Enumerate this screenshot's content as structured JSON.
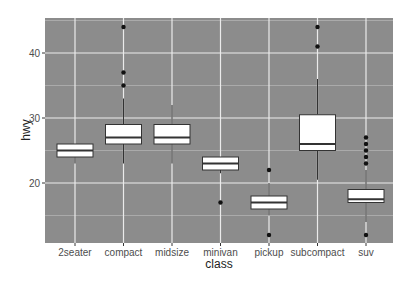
{
  "chart_data": {
    "type": "boxplot",
    "title": "",
    "xlabel": "class",
    "ylabel": "hwy",
    "ylim": [
      10.5,
      45.5
    ],
    "yticks": [
      20,
      30,
      40
    ],
    "grid": true,
    "categories": [
      "2seater",
      "compact",
      "midsize",
      "minivan",
      "pickup",
      "subcompact",
      "suv"
    ],
    "boxes": [
      {
        "category": "2seater",
        "lower_whisker": 23,
        "q1": 24,
        "median": 25,
        "q3": 26,
        "upper_whisker": 26,
        "outliers": []
      },
      {
        "category": "compact",
        "lower_whisker": 23,
        "q1": 26,
        "median": 27,
        "q3": 29,
        "upper_whisker": 33,
        "outliers": [
          35,
          37,
          44
        ]
      },
      {
        "category": "midsize",
        "lower_whisker": 23,
        "q1": 26,
        "median": 27,
        "q3": 29,
        "upper_whisker": 32,
        "outliers": []
      },
      {
        "category": "minivan",
        "lower_whisker": 21.5,
        "q1": 22,
        "median": 23,
        "q3": 24,
        "upper_whisker": 24,
        "outliers": [
          17
        ]
      },
      {
        "category": "pickup",
        "lower_whisker": 15,
        "q1": 16,
        "median": 17,
        "q3": 18,
        "upper_whisker": 20,
        "outliers": [
          12,
          22
        ]
      },
      {
        "category": "subcompact",
        "lower_whisker": 20.5,
        "q1": 25,
        "median": 26,
        "q3": 30.5,
        "upper_whisker": 36,
        "outliers": [
          41,
          44
        ]
      },
      {
        "category": "suv",
        "lower_whisker": 14,
        "q1": 17,
        "median": 17.5,
        "q3": 19,
        "upper_whisker": 22,
        "outliers": [
          12,
          23,
          24,
          25,
          26,
          27
        ]
      }
    ],
    "colors": {
      "panel": "#8c8c8c",
      "grid_major": "#ebebeb",
      "grid_minor": "#b3b3b3",
      "box_fill": "#ffffff",
      "box_line": "#333333"
    }
  }
}
